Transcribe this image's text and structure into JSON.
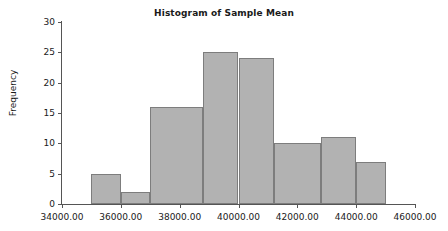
{
  "chart_data": {
    "type": "bar",
    "title": "Histogram of Sample Mean",
    "xlabel": "",
    "ylabel": "Frequency",
    "grid": false,
    "legend": "none",
    "xlim": [
      34000,
      46000
    ],
    "ylim": [
      0,
      30
    ],
    "xticks": [
      34000,
      36000,
      38000,
      40000,
      42000,
      44000,
      46000
    ],
    "xtick_labels": [
      "34000.00",
      "36000.00",
      "38000.00",
      "40000.00",
      "42000.00",
      "44000.00",
      "46000.00"
    ],
    "yticks": [
      0,
      5,
      10,
      15,
      20,
      25,
      30
    ],
    "ytick_labels": [
      "0",
      "5",
      "10",
      "15",
      "20",
      "25",
      "30"
    ],
    "bin_width": 1000,
    "bins": [
      {
        "start": 35000,
        "end": 36000,
        "value": 5
      },
      {
        "start": 36000,
        "end": 37000,
        "value": 2
      },
      {
        "start": 37000,
        "end": 38800,
        "value": 16
      },
      {
        "start": 38800,
        "end": 40000,
        "value": 25
      },
      {
        "start": 40000,
        "end": 41200,
        "value": 24
      },
      {
        "start": 41200,
        "end": 42800,
        "value": 10
      },
      {
        "start": 42800,
        "end": 44000,
        "value": 11
      },
      {
        "start": 44000,
        "end": 45000,
        "value": 7
      }
    ],
    "categories": [
      "35000-36000",
      "36000-37000",
      "37000-38800",
      "38800-40000",
      "40000-41200",
      "41200-42800",
      "42800-44000",
      "44000-45000"
    ],
    "values": [
      5,
      2,
      16,
      25,
      24,
      10,
      11,
      7
    ],
    "colors": {
      "bar_fill": "#b2b2b2",
      "bar_border": "#7d7d7d",
      "axis": "#555555",
      "text": "#1a1a1a",
      "background": "#ffffff"
    }
  }
}
